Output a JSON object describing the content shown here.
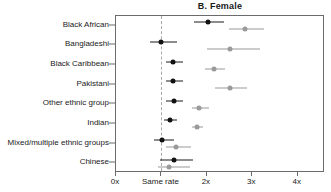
{
  "chart_data": {
    "type": "scatter",
    "title": "B. Female",
    "xlabel": "",
    "ylabel": "",
    "xlim": [
      0,
      4.6
    ],
    "grid": false,
    "legend_position": "none",
    "reference_line": {
      "value": 1,
      "label": "Same rate",
      "style": "dashed"
    },
    "xticks": [
      0,
      1,
      2,
      3,
      4
    ],
    "xticklabels": [
      "0x",
      "Same rate",
      "2x",
      "3x",
      "4x"
    ],
    "categories": [
      "Black African",
      "Bangladeshi",
      "Black Caribbean",
      "Pakistani",
      "Other ethnic group",
      "Indian",
      "Mixed/multiple ethnic groups",
      "Chinese"
    ],
    "series": [
      {
        "name": "dark",
        "color": "#111111",
        "values": [
          2.02,
          1.0,
          1.25,
          1.25,
          1.27,
          1.18,
          1.02,
          1.27
        ],
        "ci_low": [
          1.72,
          0.74,
          1.09,
          1.1,
          1.1,
          1.06,
          0.84,
          0.96
        ],
        "ci_high": [
          2.37,
          1.34,
          1.48,
          1.47,
          1.47,
          1.35,
          1.27,
          1.7
        ]
      },
      {
        "name": "light",
        "color": "#9a9a9a",
        "values": [
          2.85,
          2.5,
          2.15,
          2.5,
          1.82,
          1.78,
          1.32,
          1.16
        ],
        "ci_low": [
          2.48,
          2.0,
          1.95,
          2.18,
          1.67,
          1.68,
          1.1,
          0.92
        ],
        "ci_high": [
          3.25,
          3.18,
          2.4,
          2.88,
          2.05,
          1.92,
          1.65,
          1.62
        ]
      }
    ]
  }
}
